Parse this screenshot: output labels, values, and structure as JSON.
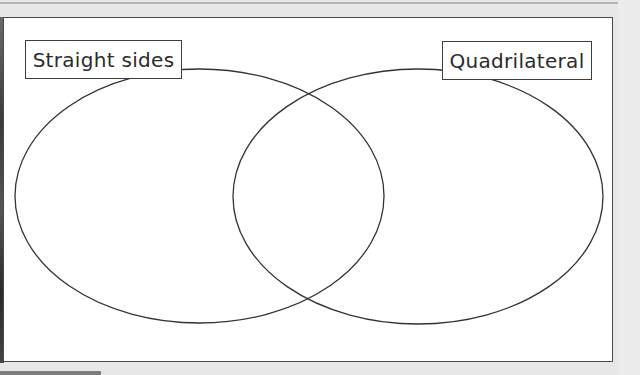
{
  "diagram": {
    "type": "venn",
    "sets": [
      {
        "id": "left",
        "label": "Straight sides"
      },
      {
        "id": "right",
        "label": "Quadrilateral"
      }
    ],
    "regions": {
      "left_only": [],
      "intersection": [],
      "right_only": []
    },
    "colors": {
      "outline": "#333333",
      "background": "#ffffff",
      "page": "#e7e7e7"
    }
  }
}
